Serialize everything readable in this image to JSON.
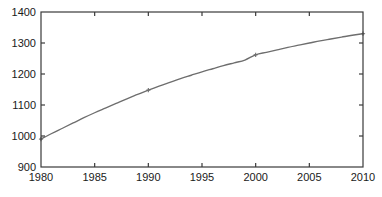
{
  "chart_data": {
    "type": "line",
    "title": "",
    "subtitle": "",
    "xlabel": "",
    "ylabel": "",
    "xlim": [
      1980,
      2010
    ],
    "ylim": [
      900,
      1400
    ],
    "grid": false,
    "legend": false,
    "legend_position": "none",
    "xticks": [
      1980,
      1985,
      1990,
      1995,
      2000,
      2005,
      2010
    ],
    "xtick_labels": [
      "1980",
      "1985",
      "1990",
      "1995",
      "2000",
      "2005",
      "2010"
    ],
    "yticks": [
      900,
      1000,
      1100,
      1200,
      1300,
      1400
    ],
    "ytick_labels": [
      "900",
      "1000",
      "1100",
      "1200",
      "1300",
      "1400"
    ],
    "line_color": "#6e6e6e",
    "marker_color": "#6e6e6e",
    "marker_style": "plus",
    "series": [
      {
        "name": "series-1",
        "x": [
          1980,
          1981,
          1982,
          1983,
          1984,
          1985,
          1986,
          1987,
          1988,
          1989,
          1990,
          1991,
          1992,
          1993,
          1994,
          1995,
          1996,
          1997,
          1998,
          1999,
          2000,
          2001,
          2002,
          2003,
          2004,
          2005,
          2006,
          2007,
          2008,
          2009,
          2010
        ],
        "values": [
          990,
          1008,
          1025,
          1042,
          1059,
          1075,
          1090,
          1105,
          1120,
          1134,
          1148,
          1161,
          1173,
          1185,
          1196,
          1207,
          1217,
          1227,
          1236,
          1245,
          1262,
          1270,
          1278,
          1286,
          1293,
          1300,
          1307,
          1313,
          1319,
          1325,
          1330
        ],
        "marker_points": [
          {
            "x": 1980,
            "y": 990
          },
          {
            "x": 1990,
            "y": 1148
          },
          {
            "x": 2000,
            "y": 1262
          },
          {
            "x": 2010,
            "y": 1330
          }
        ]
      }
    ]
  }
}
